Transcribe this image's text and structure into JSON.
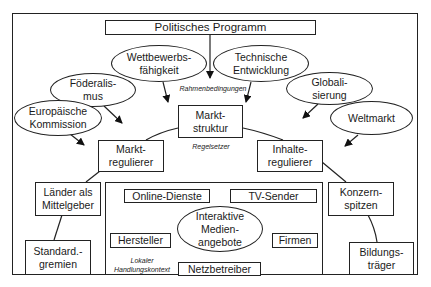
{
  "diagram": {
    "top": {
      "political_program": "Politisches Programm"
    },
    "influences": {
      "competitiveness": "Wettbewerbs-\nfähigkeit",
      "technical_development": "Technische\nEntwicklung",
      "federalism": "Föderalis-\nmus",
      "globalization": "Globali-\nsierung",
      "european_commission": "Europäische\nKommission",
      "world_market": "Weltmarkt"
    },
    "labels": {
      "framework_conditions": "Rahmenbedingungen",
      "rule_setter": "Regelsetzer",
      "local_context": "Lokaler\nHandlungskontext"
    },
    "core": {
      "market_structure": "Markt-\nstruktur",
      "market_regulator": "Markt-\nregulierer",
      "content_regulator": "Inhalte-\nregulierer"
    },
    "actors": {
      "states_funders": "Länder als\nMittelgeber",
      "standard_bodies": "Standard.-\ngremien",
      "corporate_heads": "Konzern-\nspitzen",
      "education_providers": "Bildungs-\nträger"
    },
    "local": {
      "online_services": "Online-Dienste",
      "tv_broadcasters": "TV-Sender",
      "interactive_media": "Interaktive\nMedien-\nangebote",
      "manufacturers": "Hersteller",
      "companies": "Firmen",
      "network_operators": "Netzbetreiber"
    }
  }
}
